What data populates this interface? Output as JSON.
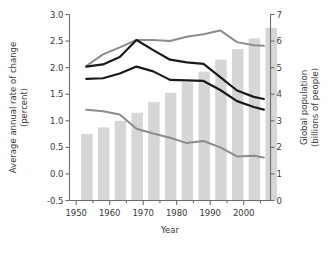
{
  "chart_data": {
    "type": "bar",
    "title": "",
    "subtitle": "",
    "xlabel": "Year",
    "ylabel": "Average annual rate of change (percent)",
    "ylabel_secondary": "Global population (billions of people)",
    "xlim": [
      1948,
      2008
    ],
    "ylim": [
      -0.5,
      3.0
    ],
    "ylim_secondary": [
      0,
      7
    ],
    "grid": false,
    "legend": "none",
    "x_ticks": [
      1950,
      1960,
      1970,
      1980,
      1990,
      2000
    ],
    "x_tick_labels": [
      "1950",
      "1960",
      "1970",
      "1980",
      "1990",
      "2000"
    ],
    "x_minor_ticks": [
      1955,
      1965,
      1975,
      1985,
      1995,
      2005
    ],
    "y_ticks": [
      -0.5,
      0.0,
      0.5,
      1.0,
      1.5,
      2.0,
      2.5,
      3.0
    ],
    "y_tick_labels": [
      "-0.5",
      "0.0",
      "0.5",
      "1.0",
      "1.5",
      "2.0",
      "2.5",
      "3.0"
    ],
    "y_ticks_secondary": [
      0,
      1,
      2,
      3,
      4,
      5,
      6,
      7
    ],
    "y_tick_labels_secondary": [
      "0",
      "1",
      "2",
      "3",
      "4",
      "5",
      "6",
      "7"
    ],
    "bars": {
      "name": "Global population",
      "axis": "secondary",
      "color": "#d6d6d6",
      "categories": [
        1950,
        1955,
        1960,
        1965,
        1970,
        1975,
        1980,
        1985,
        1990,
        1995,
        2000,
        2005
      ],
      "values": [
        2.5,
        2.75,
        3.0,
        3.3,
        3.7,
        4.05,
        4.45,
        4.85,
        5.3,
        5.7,
        6.1,
        6.5
      ]
    },
    "series": [
      {
        "name": "Less developed regions growth rate",
        "axis": "primary",
        "color": "#8c8c8c",
        "width": 2.0,
        "x": [
          1953,
          1958,
          1963,
          1968,
          1973,
          1978,
          1983,
          1988,
          1993,
          1998,
          2003,
          2006
        ],
        "values": [
          2.03,
          2.25,
          2.38,
          2.52,
          2.52,
          2.5,
          2.58,
          2.63,
          2.7,
          2.48,
          2.42,
          2.41
        ]
      },
      {
        "name": "World growth rate",
        "axis": "primary",
        "color": "#1a1a1a",
        "width": 2.2,
        "x": [
          1953,
          1958,
          1963,
          1968,
          1973,
          1978,
          1983,
          1988,
          1993,
          1998,
          2003,
          2006
        ],
        "values": [
          2.02,
          2.06,
          2.2,
          2.52,
          2.33,
          2.15,
          2.1,
          2.07,
          1.82,
          1.57,
          1.45,
          1.41
        ]
      },
      {
        "name": "More developed regions growth rate",
        "axis": "primary",
        "color": "#1a1a1a",
        "width": 2.2,
        "x": [
          1953,
          1958,
          1963,
          1968,
          1973,
          1978,
          1983,
          1988,
          1993,
          1998,
          2003,
          2006
        ],
        "values": [
          1.79,
          1.8,
          1.89,
          2.02,
          1.93,
          1.77,
          1.76,
          1.75,
          1.58,
          1.37,
          1.26,
          1.21
        ]
      },
      {
        "name": "Least developed regions growth rate",
        "axis": "primary",
        "color": "#8c8c8c",
        "width": 2.0,
        "x": [
          1953,
          1958,
          1963,
          1968,
          1973,
          1978,
          1983,
          1988,
          1993,
          1998,
          2003,
          2006
        ],
        "values": [
          1.21,
          1.18,
          1.12,
          0.85,
          0.76,
          0.68,
          0.58,
          0.62,
          0.5,
          0.33,
          0.34,
          0.31
        ]
      }
    ]
  }
}
